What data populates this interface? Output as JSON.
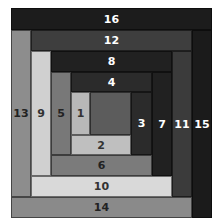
{
  "blocks": [
    {
      "label": "",
      "name": "center",
      "x": 90,
      "y": 92,
      "w": 41,
      "h": 43,
      "color": "#5c5c5c",
      "text": "#ffffff"
    },
    {
      "label": "1",
      "name": "strip-1",
      "x": 71,
      "y": 92,
      "w": 19,
      "h": 43,
      "color": "#b8b8b8",
      "text": "#333333"
    },
    {
      "label": "2",
      "name": "strip-2",
      "x": 71,
      "y": 135,
      "w": 60,
      "h": 20,
      "color": "#bfbfbf",
      "text": "#333333"
    },
    {
      "label": "3",
      "name": "strip-3",
      "x": 131,
      "y": 92,
      "w": 21,
      "h": 63,
      "color": "#2b2b2b",
      "text": "#ffffff"
    },
    {
      "label": "4",
      "name": "strip-4",
      "x": 71,
      "y": 72,
      "w": 81,
      "h": 20,
      "color": "#2b2b2b",
      "text": "#ffffff"
    },
    {
      "label": "5",
      "name": "strip-5",
      "x": 51,
      "y": 72,
      "w": 20,
      "h": 83,
      "color": "#787878",
      "text": "#222222"
    },
    {
      "label": "6",
      "name": "strip-6",
      "x": 51,
      "y": 155,
      "w": 101,
      "h": 21,
      "color": "#7b7b7b",
      "text": "#222222"
    },
    {
      "label": "7",
      "name": "strip-7",
      "x": 152,
      "y": 72,
      "w": 20,
      "h": 104,
      "color": "#212121",
      "text": "#ffffff"
    },
    {
      "label": "8",
      "name": "strip-8",
      "x": 51,
      "y": 51,
      "w": 121,
      "h": 21,
      "color": "#212121",
      "text": "#ffffff"
    },
    {
      "label": "9",
      "name": "strip-9",
      "x": 31,
      "y": 51,
      "w": 20,
      "h": 125,
      "color": "#d0d0d0",
      "text": "#333333"
    },
    {
      "label": "10",
      "name": "strip-10",
      "x": 31,
      "y": 176,
      "w": 141,
      "h": 21,
      "color": "#d9d9d9",
      "text": "#333333"
    },
    {
      "label": "11",
      "name": "strip-11",
      "x": 172,
      "y": 51,
      "w": 20,
      "h": 146,
      "color": "#3b3b3b",
      "text": "#ffffff"
    },
    {
      "label": "12",
      "name": "strip-12",
      "x": 31,
      "y": 30,
      "w": 161,
      "h": 21,
      "color": "#3e3e3e",
      "text": "#ffffff"
    },
    {
      "label": "13",
      "name": "strip-13",
      "x": 11,
      "y": 30,
      "w": 20,
      "h": 167,
      "color": "#8d8d8d",
      "text": "#222222"
    },
    {
      "label": "14",
      "name": "strip-14",
      "x": 11,
      "y": 197,
      "w": 181,
      "h": 21,
      "color": "#8a8a8a",
      "text": "#222222"
    },
    {
      "label": "15",
      "name": "strip-15",
      "x": 192,
      "y": 30,
      "w": 20,
      "h": 188,
      "color": "#1b1b1b",
      "text": "#ffffff"
    },
    {
      "label": "16",
      "name": "strip-16",
      "x": 11,
      "y": 8,
      "w": 201,
      "h": 22,
      "color": "#1c1c1c",
      "text": "#ffffff"
    }
  ]
}
